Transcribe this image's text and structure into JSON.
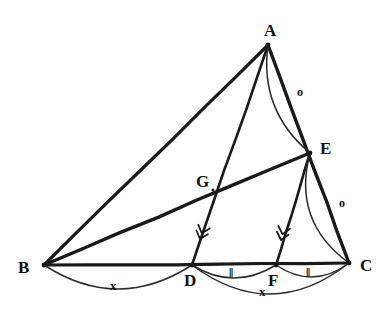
{
  "figure": {
    "stroke_color": "#1a1a1a",
    "arc_color": "#2b2b2b",
    "background_color": "#ffffff",
    "width": 391,
    "height": 319
  },
  "points": [
    {
      "id": "A",
      "label": "A",
      "x": 268,
      "y": 45,
      "label_x": 264,
      "label_y": 22
    },
    {
      "id": "B",
      "label": "B",
      "x": 44,
      "y": 265,
      "label_x": 18,
      "label_y": 259
    },
    {
      "id": "C",
      "label": "C",
      "x": 349,
      "y": 263,
      "label_x": 360,
      "label_y": 257
    },
    {
      "id": "D",
      "label": "D",
      "x": 192,
      "y": 265,
      "label_x": 184,
      "label_y": 272
    },
    {
      "id": "E",
      "label": "E",
      "x": 310,
      "y": 153,
      "label_x": 320,
      "label_y": 140
    },
    {
      "id": "F",
      "label": "F",
      "x": 276,
      "y": 265,
      "label_x": 268,
      "label_y": 272
    },
    {
      "id": "G",
      "label": "G",
      "x": 213,
      "y": 190,
      "label_x": 196,
      "label_y": 173
    }
  ],
  "segments": [
    {
      "id": "AB",
      "from": "A",
      "to": "B",
      "width": 3.2
    },
    {
      "id": "AC",
      "from": "A",
      "to": "C",
      "width": 3.4
    },
    {
      "id": "BC",
      "from": "B",
      "to": "C",
      "width": 3.2
    },
    {
      "id": "AD",
      "from": "A",
      "to": "D",
      "width": 2.6
    },
    {
      "id": "BE",
      "from": "B",
      "to": "E",
      "width": 3.4
    },
    {
      "id": "EF",
      "from": "E",
      "to": "F",
      "width": 2.6
    }
  ],
  "arcs": [
    {
      "id": "arc-angle-A",
      "from": "A",
      "to": "E",
      "bulge": 16,
      "label": "o",
      "label_x": 297,
      "label_y": 86
    },
    {
      "id": "arc-angle-E",
      "from": "E",
      "to": "C",
      "bulge": 20,
      "label": "o",
      "label_x": 339,
      "label_y": 197
    },
    {
      "id": "arc-BD",
      "from": "B",
      "to": "D",
      "bulge": 24,
      "label": "x",
      "label_x": 110,
      "label_y": 279
    },
    {
      "id": "arc-DF",
      "from": "D",
      "to": "F",
      "bulge": 13,
      "label": "‖",
      "label_x": 229,
      "label_y": 266
    },
    {
      "id": "arc-FC",
      "from": "F",
      "to": "C",
      "bulge": 13,
      "label": "‖",
      "label_x": 306,
      "label_y": 266
    },
    {
      "id": "arc-DC",
      "from": "D",
      "to": "C",
      "bulge": 30,
      "label": "x",
      "label_x": 259,
      "label_y": 285
    }
  ],
  "parallel_arrows": [
    {
      "id": "arrow-on-AD",
      "on_segment": "AD",
      "x": 200,
      "y": 239,
      "angle_deg": 108,
      "count": 2
    },
    {
      "id": "arrow-on-EF",
      "on_segment": "EF",
      "x": 281,
      "y": 240,
      "angle_deg": 104,
      "count": 2
    }
  ],
  "markers": {
    "angle_o_label": "o",
    "equal_x_label": "x",
    "equal_tick_label": "‖"
  }
}
